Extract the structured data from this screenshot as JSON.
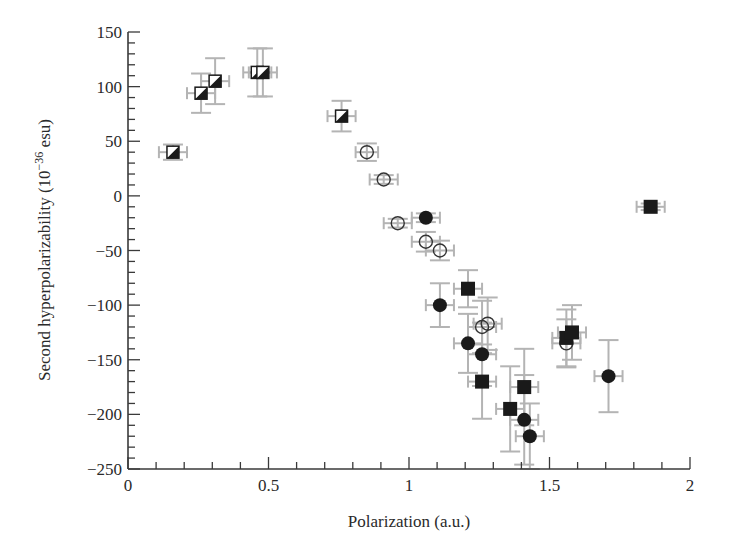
{
  "chart_data": {
    "type": "scatter",
    "title": "",
    "xlabel": "Polarization (a.u.)",
    "ylabel": "Second hyperpolarizability (10",
    "ylabel_sup": "−36",
    "ylabel_tail": " esu)",
    "xlim": [
      0,
      2
    ],
    "ylim": [
      -250,
      150
    ],
    "x_ticks": [
      0,
      0.5,
      1,
      1.5,
      2
    ],
    "x_tick_labels": [
      "0",
      "0.5",
      "1",
      "1.5",
      "2"
    ],
    "x_minor_step": 0.1,
    "y_ticks": [
      150,
      100,
      50,
      0,
      -50,
      -100,
      -150,
      -200,
      -250
    ],
    "y_tick_labels": [
      "150",
      "100",
      "50",
      "0",
      "−50",
      "−100",
      "−150",
      "−200",
      "−250"
    ],
    "y_minor_step": 10,
    "grid": false,
    "legend": null,
    "colors": {
      "marker": "#1a1a1a",
      "error_bar": "#b4b4b4",
      "axis": "#3a3a3a"
    },
    "series": [
      {
        "name": "half-filled squares",
        "marker": "half-square",
        "points": [
          {
            "x": 0.16,
            "y": 40,
            "xerr": 0.05,
            "yerr": 7
          },
          {
            "x": 0.26,
            "y": 94,
            "xerr": 0.05,
            "yerr": 18
          },
          {
            "x": 0.31,
            "y": 105,
            "xerr": 0.05,
            "yerr": 21
          },
          {
            "x": 0.46,
            "y": 113,
            "xerr": 0.05,
            "yerr": 22
          },
          {
            "x": 0.48,
            "y": 113,
            "xerr": 0.05,
            "yerr": 22
          },
          {
            "x": 0.76,
            "y": 73,
            "xerr": 0.05,
            "yerr": 14
          }
        ]
      },
      {
        "name": "open circles",
        "marker": "open-circle",
        "points": [
          {
            "x": 0.85,
            "y": 40,
            "xerr": 0.04,
            "yerr": 8
          },
          {
            "x": 0.91,
            "y": 15,
            "xerr": 0.05,
            "yerr": 4
          },
          {
            "x": 0.96,
            "y": -25,
            "xerr": 0.05,
            "yerr": 4
          },
          {
            "x": 1.06,
            "y": -42,
            "xerr": 0.05,
            "yerr": 9
          },
          {
            "x": 1.11,
            "y": -50,
            "xerr": 0.05,
            "yerr": 9
          },
          {
            "x": 1.26,
            "y": -120,
            "xerr": 0.05,
            "yerr": 24
          },
          {
            "x": 1.28,
            "y": -117,
            "xerr": 0.05,
            "yerr": 24
          },
          {
            "x": 1.56,
            "y": -135,
            "xerr": 0.05,
            "yerr": 22
          }
        ]
      },
      {
        "name": "filled circles",
        "marker": "filled-circle",
        "points": [
          {
            "x": 1.06,
            "y": -20,
            "xerr": 0.05,
            "yerr": 4
          },
          {
            "x": 1.11,
            "y": -100,
            "xerr": 0.05,
            "yerr": 20
          },
          {
            "x": 1.21,
            "y": -135,
            "xerr": 0.05,
            "yerr": 27
          },
          {
            "x": 1.26,
            "y": -145,
            "xerr": 0.05,
            "yerr": 29
          },
          {
            "x": 1.41,
            "y": -205,
            "xerr": 0.05,
            "yerr": 41
          },
          {
            "x": 1.43,
            "y": -220,
            "xerr": 0.05,
            "yerr": 30
          },
          {
            "x": 1.71,
            "y": -165,
            "xerr": 0.05,
            "yerr": 33
          }
        ]
      },
      {
        "name": "filled squares",
        "marker": "filled-square",
        "points": [
          {
            "x": 1.21,
            "y": -85,
            "xerr": 0.05,
            "yerr": 17
          },
          {
            "x": 1.26,
            "y": -170,
            "xerr": 0.05,
            "yerr": 34
          },
          {
            "x": 1.36,
            "y": -195,
            "xerr": 0.05,
            "yerr": 39
          },
          {
            "x": 1.41,
            "y": -175,
            "xerr": 0.05,
            "yerr": 35
          },
          {
            "x": 1.56,
            "y": -130,
            "xerr": 0.05,
            "yerr": 26
          },
          {
            "x": 1.58,
            "y": -125,
            "xerr": 0.05,
            "yerr": 25
          },
          {
            "x": 1.86,
            "y": -10,
            "xerr": 0.05,
            "yerr": 3
          }
        ]
      }
    ]
  }
}
